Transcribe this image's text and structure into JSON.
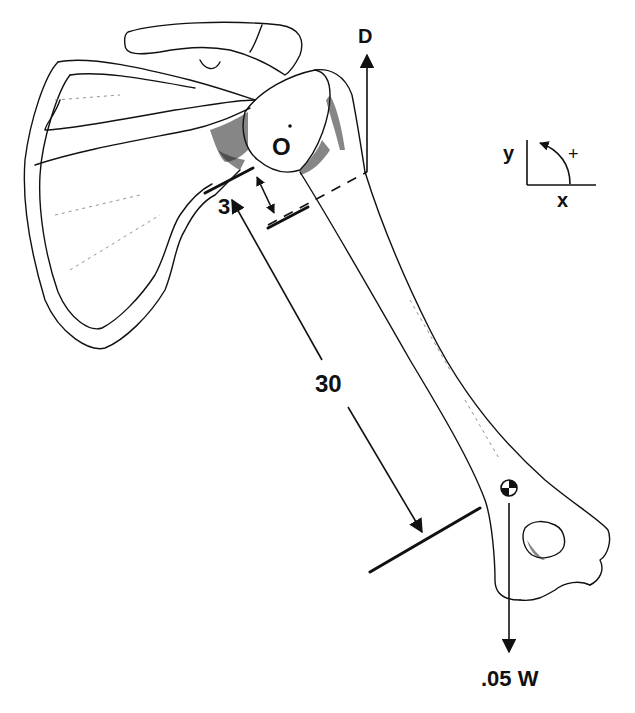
{
  "diagram": {
    "labels": {
      "deltoid_force": "D",
      "joint_center": "O",
      "short_distance": "3",
      "long_distance": "30",
      "arm_weight": ".05 W",
      "axis_y": "y",
      "axis_x": "x",
      "rotation_sign": "+"
    },
    "colors": {
      "ink": "#111111",
      "background": "#ffffff"
    },
    "icons": {
      "center_of_mass": "center-of-mass-symbol",
      "coordinate_axes": "xy-axes-with-rotation-arrow"
    }
  }
}
